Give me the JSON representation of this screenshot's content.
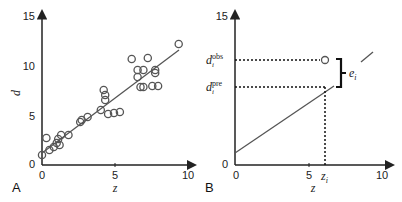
{
  "chart_data": [
    {
      "panel": "A",
      "type": "scatter",
      "xlabel": "z",
      "ylabel": "d",
      "xlim": [
        0,
        10
      ],
      "ylim": [
        0,
        15
      ],
      "xticks": [
        "0",
        "5",
        "10"
      ],
      "yticks": [
        "0",
        "5",
        "10",
        "15"
      ],
      "grid": false,
      "fit_line": {
        "x": [
          0,
          9.3
        ],
        "y": [
          1.2,
          11.5
        ]
      },
      "points": [
        {
          "x": 0.0,
          "y": 1.0
        },
        {
          "x": 0.3,
          "y": 2.7
        },
        {
          "x": 0.5,
          "y": 1.5
        },
        {
          "x": 0.8,
          "y": 1.8
        },
        {
          "x": 1.0,
          "y": 2.2
        },
        {
          "x": 1.1,
          "y": 2.6
        },
        {
          "x": 1.2,
          "y": 2.0
        },
        {
          "x": 1.3,
          "y": 3.0
        },
        {
          "x": 1.8,
          "y": 3.0
        },
        {
          "x": 2.6,
          "y": 4.3
        },
        {
          "x": 2.7,
          "y": 4.5
        },
        {
          "x": 3.1,
          "y": 4.8
        },
        {
          "x": 4.0,
          "y": 5.5
        },
        {
          "x": 4.2,
          "y": 7.5
        },
        {
          "x": 4.3,
          "y": 7.0
        },
        {
          "x": 4.3,
          "y": 6.5
        },
        {
          "x": 4.5,
          "y": 5.1
        },
        {
          "x": 4.9,
          "y": 5.2
        },
        {
          "x": 5.3,
          "y": 5.3
        },
        {
          "x": 6.1,
          "y": 10.6
        },
        {
          "x": 6.5,
          "y": 9.5
        },
        {
          "x": 6.5,
          "y": 8.8
        },
        {
          "x": 6.7,
          "y": 7.8
        },
        {
          "x": 6.9,
          "y": 7.8
        },
        {
          "x": 6.9,
          "y": 9.5
        },
        {
          "x": 7.2,
          "y": 10.7
        },
        {
          "x": 7.5,
          "y": 7.9
        },
        {
          "x": 7.7,
          "y": 9.5
        },
        {
          "x": 7.7,
          "y": 9.2
        },
        {
          "x": 7.9,
          "y": 7.9
        },
        {
          "x": 9.3,
          "y": 12.1
        }
      ]
    },
    {
      "panel": "B",
      "type": "line",
      "xlabel": "z",
      "xlim": [
        0,
        10
      ],
      "ylim": [
        0,
        15
      ],
      "xticks": [
        "0",
        "5",
        "10"
      ],
      "yticks": [
        "0",
        "15"
      ],
      "line": {
        "x": [
          0,
          10
        ],
        "y": [
          1.2,
          11.5
        ]
      },
      "observed_point": {
        "x": 6.1,
        "y": 10.5
      },
      "predicted_value": 7.8,
      "z_i": 6.1,
      "annotations": {
        "d_obs": "d_i^obs",
        "d_pre": "d_i^pre",
        "error": "e_i",
        "z_i": "z_i"
      }
    }
  ],
  "labels": {
    "panel_a": "A",
    "panel_b": "B",
    "x_axis": "z",
    "y_axis": "d",
    "tick_0": "0",
    "tick_5": "5",
    "tick_10": "10",
    "tick_15": "15",
    "d_base": "d",
    "sub_i": "i",
    "sup_obs": "obs",
    "sup_pre": "pre",
    "e_base": "e",
    "z_base": "z"
  }
}
